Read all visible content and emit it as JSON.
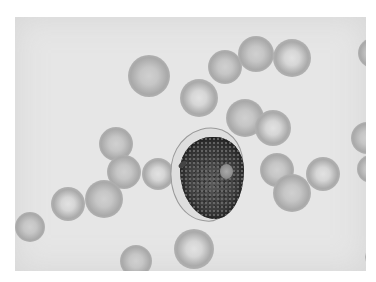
{
  "image": {
    "description": "Grayscale light micrograph of a blood smear showing a large dark-staining cell with granular nucleus and a pale nucleolus, surrounded by red blood cells",
    "colors": {
      "background": "#e6e6e6",
      "rbc": "#b0b0b0",
      "nucleus": "#3a3a3a",
      "border": "#ffffff"
    }
  },
  "rbcs": [
    {
      "x": 113,
      "y": 38,
      "d": 42
    },
    {
      "x": 165,
      "y": 62,
      "d": 38
    },
    {
      "x": 193,
      "y": 33,
      "d": 34
    },
    {
      "x": 223,
      "y": 19,
      "d": 36
    },
    {
      "x": 258,
      "y": 22,
      "d": 38
    },
    {
      "x": 343,
      "y": 21,
      "d": 30
    },
    {
      "x": 211,
      "y": 82,
      "d": 38
    },
    {
      "x": 240,
      "y": 93,
      "d": 36
    },
    {
      "x": 84,
      "y": 110,
      "d": 34
    },
    {
      "x": 92,
      "y": 138,
      "d": 34
    },
    {
      "x": 127,
      "y": 141,
      "d": 32
    },
    {
      "x": 245,
      "y": 136,
      "d": 34
    },
    {
      "x": 258,
      "y": 157,
      "d": 38
    },
    {
      "x": 291,
      "y": 140,
      "d": 34
    },
    {
      "x": 336,
      "y": 105,
      "d": 32
    },
    {
      "x": 342,
      "y": 138,
      "d": 28
    },
    {
      "x": 36,
      "y": 170,
      "d": 34
    },
    {
      "x": 70,
      "y": 163,
      "d": 38
    },
    {
      "x": 0,
      "y": 195,
      "d": 30
    },
    {
      "x": 159,
      "y": 212,
      "d": 40
    },
    {
      "x": 105,
      "y": 228,
      "d": 32
    },
    {
      "x": 352,
      "y": 210,
      "d": 20
    },
    {
      "x": 350,
      "y": 230,
      "d": 20
    }
  ]
}
